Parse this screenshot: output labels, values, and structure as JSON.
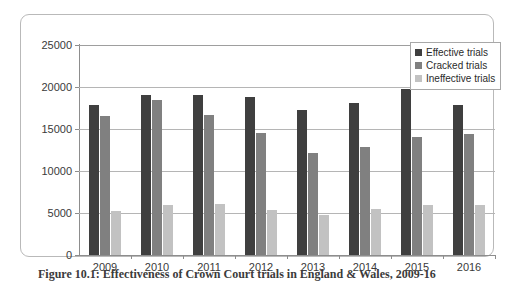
{
  "figure": {
    "caption": "Figure 10.1: Effectiveness of Crown Court trials in England & Wales, 2009-16"
  },
  "legend": {
    "position": "top-right",
    "items": [
      {
        "label": "Effective trials",
        "color": "#3f3f3f"
      },
      {
        "label": "Cracked trials",
        "color": "#808080"
      },
      {
        "label": "Ineffective trials",
        "color": "#c2c2c2"
      }
    ]
  },
  "chart_data": {
    "type": "bar",
    "title": "",
    "xlabel": "",
    "ylabel": "",
    "grid": true,
    "ylim": [
      0,
      25000
    ],
    "yticks": [
      0,
      5000,
      10000,
      15000,
      20000,
      25000
    ],
    "ytick_labels": [
      "0",
      "5000",
      "10000",
      "15000",
      "20000",
      "25000"
    ],
    "categories": [
      "2009",
      "2010",
      "2011",
      "2012",
      "2013",
      "2014",
      "2015",
      "2016"
    ],
    "series": [
      {
        "name": "Effective trials",
        "color": "#3f3f3f",
        "values": [
          17900,
          19000,
          19100,
          18800,
          17300,
          18100,
          19800,
          17900
        ]
      },
      {
        "name": "Cracked trials",
        "color": "#808080",
        "values": [
          16500,
          18500,
          16700,
          14500,
          12100,
          12800,
          14000,
          14400
        ]
      },
      {
        "name": "Ineffective trials",
        "color": "#c2c2c2",
        "values": [
          5200,
          6000,
          6100,
          5300,
          4800,
          5500,
          6000,
          5900
        ]
      }
    ]
  }
}
